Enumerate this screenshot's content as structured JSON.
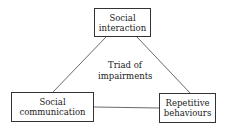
{
  "diagram": {
    "nodes": {
      "top": {
        "line1": "Social",
        "line2": "interaction"
      },
      "left": {
        "line1": "Social",
        "line2": "communication"
      },
      "right": {
        "line1": "Repetitive",
        "line2": "behaviours"
      }
    },
    "center": {
      "line1": "Triad of",
      "line2": "impairments"
    },
    "edges": [
      [
        "top",
        "left"
      ],
      [
        "top",
        "right"
      ],
      [
        "left",
        "right"
      ]
    ]
  }
}
